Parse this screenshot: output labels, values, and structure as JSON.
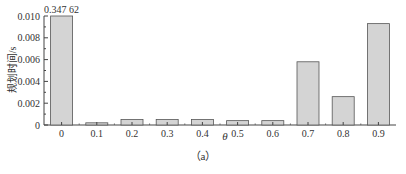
{
  "chart_data": {
    "type": "bar",
    "title": "",
    "xlabel": "θ",
    "ylabel": "规划时间/s",
    "caption": "（a）",
    "categories": [
      "0",
      "0.1",
      "0.2",
      "0.3",
      "0.4",
      "0.5",
      "0.6",
      "0.7",
      "0.8",
      "0.9"
    ],
    "values": [
      0.34762,
      0.0002,
      0.0005,
      0.0005,
      0.0005,
      0.0004,
      0.0004,
      0.0058,
      0.0026,
      0.0093
    ],
    "annotations": [
      {
        "category": "0",
        "text": "0.347 62",
        "note": "bar clipped at axis top"
      }
    ],
    "ylim": [
      0,
      0.01
    ],
    "yticks": [
      "0",
      "0.002",
      "0.004",
      "0.006",
      "0.008",
      "0.010"
    ],
    "grid": false,
    "legend": null,
    "bar_color": "#d4d4d4",
    "bar_edge_color": "#555555"
  }
}
